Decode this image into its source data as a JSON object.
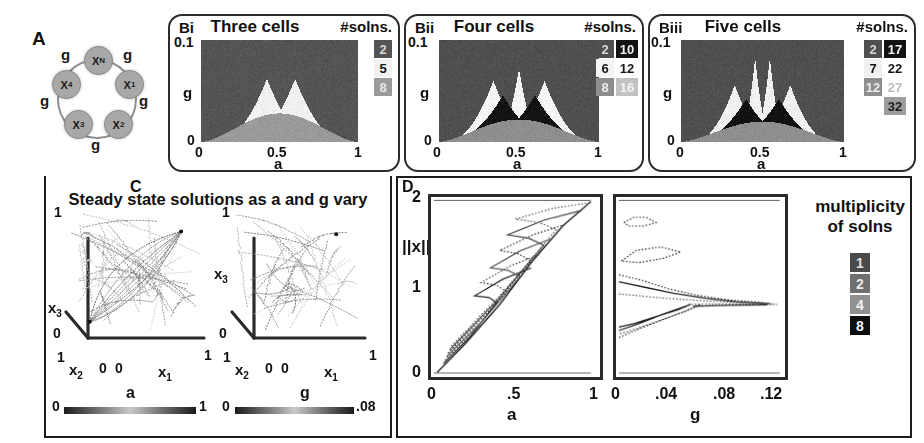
{
  "figure": {
    "panels": [
      "A",
      "Bi",
      "Bii",
      "Biii",
      "C",
      "D"
    ]
  },
  "panel_a": {
    "letter": "A",
    "nodes": [
      {
        "id": "node-xn",
        "label": "X",
        "sub": "N"
      },
      {
        "id": "node-x1",
        "label": "X",
        "sub": "1"
      },
      {
        "id": "node-x2",
        "label": "X",
        "sub": "2"
      },
      {
        "id": "node-x3",
        "label": "X",
        "sub": "3"
      },
      {
        "id": "node-x4",
        "label": "X",
        "sub": "4"
      }
    ],
    "edge_labels": [
      "g",
      "g",
      "g",
      "g",
      "g",
      "g"
    ],
    "node_color": "#a8a8a8",
    "ring_color": "#8e8e8e"
  },
  "panel_bi": {
    "letter": "Bi",
    "title": "Three cells",
    "solns_header": "#solns.",
    "y_top": "0.1",
    "y_bottom": "0",
    "y_name": "g",
    "x_ticks": [
      "0",
      "0.5",
      "1"
    ],
    "x_name": "a",
    "legend": [
      {
        "value": "2",
        "bg": "#545454",
        "fg": "#d8d8d8"
      },
      {
        "value": "5",
        "bg": "#f2f2f2",
        "fg": "#151515"
      },
      {
        "value": "8",
        "bg": "#9a9a9a",
        "fg": "#e8e8e8"
      }
    ]
  },
  "panel_bii": {
    "letter": "Bii",
    "title": "Four cells",
    "solns_header": "#solns.",
    "y_top": "0.1",
    "y_bottom": "0",
    "y_name": "g",
    "x_ticks": [
      "0",
      "0.5",
      "1"
    ],
    "x_name": "a",
    "legend_col1": [
      {
        "value": "2",
        "bg": "#4f4f4f",
        "fg": "#d6d6d6"
      },
      {
        "value": "6",
        "bg": "#f4f4f4",
        "fg": "#151515"
      },
      {
        "value": "8",
        "bg": "#8e8e8e",
        "fg": "#ededed"
      }
    ],
    "legend_col2": [
      {
        "value": "10",
        "bg": "#131313",
        "fg": "#f0f0f0"
      },
      {
        "value": "12",
        "bg": "#ffffff",
        "fg": "#151515"
      },
      {
        "value": "16",
        "bg": "#c2c2c2",
        "fg": "#f4f4f4"
      }
    ]
  },
  "panel_biii": {
    "letter": "Biii",
    "title": "Five cells",
    "solns_header": "#solns.",
    "y_top": "0.1",
    "y_bottom": "0",
    "y_name": "g",
    "x_ticks": [
      "0",
      "0.5",
      "1"
    ],
    "x_name": "a",
    "legend_col1": [
      {
        "value": "2",
        "bg": "#4f4f4f",
        "fg": "#d6d6d6"
      },
      {
        "value": "7",
        "bg": "#f0f0f0",
        "fg": "#151515"
      },
      {
        "value": "12",
        "bg": "#8e8e8e",
        "fg": "#ededed"
      }
    ],
    "legend_col2": [
      {
        "value": "17",
        "bg": "#121212",
        "fg": "#f2f2f2"
      },
      {
        "value": "22",
        "bg": "#ffffff",
        "fg": "#151515"
      },
      {
        "value": "27",
        "bg": "#ffffff",
        "fg": "#bdbdbd"
      },
      {
        "value": "32",
        "bg": "#9d9d9d",
        "fg": "#1c1c1c"
      }
    ]
  },
  "panel_c": {
    "letter": "C",
    "title": "Steady state solutions as a and g vary",
    "plots": [
      {
        "name": "plot-a",
        "y_top": "1",
        "y_zero": "0",
        "y_name": "x",
        "y_sub": "3",
        "x2_top": "1",
        "x2_zero": "0",
        "x2_name": "x",
        "x2_sub": "2",
        "x1_zero": "0",
        "x1_one": "1",
        "x1_name": "x",
        "x1_sub": "1",
        "colorbar": {
          "name": "a",
          "min": "0",
          "max": "1"
        }
      },
      {
        "name": "plot-g",
        "y_top": "1",
        "y_zero": "0",
        "y_name": "x",
        "y_sub": "3",
        "x2_top": "1",
        "x2_zero": "0",
        "x2_name": "x",
        "x2_sub": "2",
        "x1_zero": "0",
        "x1_one": "1",
        "x1_name": "x",
        "x1_sub": "1",
        "colorbar": {
          "name": "g",
          "min": "0",
          "max": ".08"
        }
      }
    ]
  },
  "panel_d": {
    "letter": "D",
    "y_label": "||x||",
    "y_ticks": [
      "2",
      "1",
      "0"
    ],
    "left_plot": {
      "x_ticks": [
        "0",
        ".5",
        "1"
      ],
      "x_name": "a"
    },
    "right_plot": {
      "x_ticks": [
        "0",
        ".04",
        ".08",
        ".12"
      ],
      "x_name": "g"
    },
    "legend_title_line1": "multiplicity",
    "legend_title_line2": "of solns",
    "legend": [
      {
        "value": "1",
        "bg": "#494949",
        "fg": "#e0e0e0"
      },
      {
        "value": "2",
        "bg": "#6f6f6f",
        "fg": "#eaeaea"
      },
      {
        "value": "4",
        "bg": "#909090",
        "fg": "#f2f2f2"
      },
      {
        "value": "8",
        "bg": "#0e0e0e",
        "fg": "#f4f4f4"
      }
    ]
  },
  "chart_data": [
    {
      "type": "heatmap",
      "name": "Bi",
      "title": "Three cells",
      "xlabel": "a",
      "ylabel": "g",
      "xlim": [
        0,
        1
      ],
      "ylim": [
        0,
        0.1
      ],
      "legend_label": "#solns.",
      "levels": [
        2,
        5,
        8
      ],
      "level_colors": [
        "#545454",
        "#f2f2f2",
        "#9a9a9a"
      ],
      "description": "Background region of 2 solutions; two light cusp wedges of 5 solutions meeting near a=0.5; a medium-gray band of 8 solutions along the bottom (small g)."
    },
    {
      "type": "heatmap",
      "name": "Bii",
      "title": "Four cells",
      "xlabel": "a",
      "ylabel": "g",
      "xlim": [
        0,
        1
      ],
      "ylim": [
        0,
        0.1
      ],
      "legend_label": "#solns.",
      "levels": [
        2,
        6,
        8,
        10,
        12,
        16
      ],
      "level_colors": [
        "#4f4f4f",
        "#f4f4f4",
        "#8e8e8e",
        "#131313",
        "#ffffff",
        "#c2c2c2"
      ],
      "description": "Dark background (2); three light cusp spikes peaking near a=0.38, 0.5, 0.62; black wedges (10) beneath them; gray basal band (8)."
    },
    {
      "type": "heatmap",
      "name": "Biii",
      "title": "Five cells",
      "xlabel": "a",
      "ylabel": "g",
      "xlim": [
        0,
        1
      ],
      "ylim": [
        0,
        0.1
      ],
      "legend_label": "#solns.",
      "levels": [
        2,
        7,
        12,
        17,
        22,
        27,
        32
      ],
      "level_colors": [
        "#4f4f4f",
        "#f0f0f0",
        "#8e8e8e",
        "#121212",
        "#ffffff",
        "#ffffff",
        "#9d9d9d"
      ],
      "description": "Dark background (2); nested light cusps around a=0.45 and a=0.55 with outer spikes near a=0.33 and a=0.67; black wedges beneath; gray basal band."
    },
    {
      "type": "scatter",
      "name": "C-left",
      "title": "Steady state solutions as a and g vary",
      "xlabel": "x1",
      "ylabel": "x2",
      "zlabel": "x3",
      "xlim": [
        0,
        1
      ],
      "ylim": [
        0,
        1
      ],
      "zlim": [
        0,
        1
      ],
      "colorbar": {
        "label": "a",
        "min": 0,
        "max": 1
      },
      "description": "3D scatter of steady state branches colored by parameter a; dense loops around the unit cube with rays converging to the (1,1,1) corner."
    },
    {
      "type": "scatter",
      "name": "C-right",
      "xlabel": "x1",
      "ylabel": "x2",
      "zlabel": "x3",
      "xlim": [
        0,
        1
      ],
      "ylim": [
        0,
        1
      ],
      "zlim": [
        0,
        1
      ],
      "colorbar": {
        "label": "g",
        "min": 0,
        "max": 0.08
      },
      "description": "3D scatter of steady state branches colored by coupling g; sparser arcs clustered in the lower half of the cube."
    },
    {
      "type": "line",
      "name": "D-left",
      "xlabel": "a",
      "ylabel": "||x||",
      "xlim": [
        0,
        1
      ],
      "ylim": [
        0,
        2
      ],
      "xticks": [
        0,
        0.5,
        1
      ],
      "yticks": [
        0,
        1,
        2
      ],
      "description": "Bifurcation diagram of solution norm versus a; branches emanate from the origin and fold back repeatedly creating a zig-zag of saddle-node turning points, reaching ||x||=2 at a=1."
    },
    {
      "type": "line",
      "name": "D-right",
      "xlabel": "g",
      "ylabel": "||x||",
      "xlim": [
        0,
        0.13
      ],
      "ylim": [
        0,
        2
      ],
      "xticks": [
        0,
        0.04,
        0.08,
        0.12
      ],
      "description": "Bifurcation diagram of solution norm versus g; branches pinch together and annihilate in fold pairs as g increases, collapsing toward a single branch near ||x||=0.8."
    }
  ]
}
